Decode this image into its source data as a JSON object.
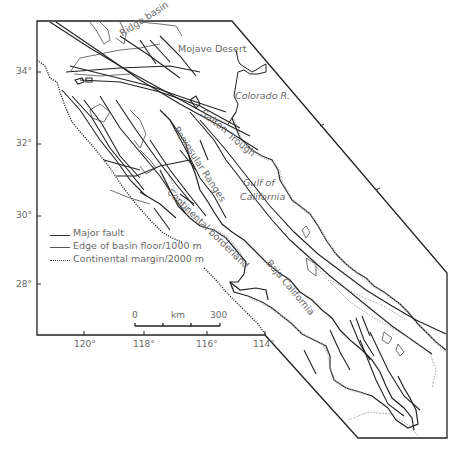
{
  "map": {
    "region_labels": {
      "ridge_basin": "Ridge basin",
      "mojave_desert": "Mojave Desert",
      "colorado_r": "Colorado R.",
      "salton": "Salton",
      "trough": "Trough",
      "peninsular_ranges": "Peninsular Ranges",
      "gulf_of": "Gulf of",
      "california": "California",
      "continental_borderland": "Continental borderland",
      "baja_california": "Baja California"
    },
    "latitude_ticks": [
      "34°",
      "32°",
      "30°",
      "28°"
    ],
    "longitude_ticks": [
      "120°",
      "118°",
      "116°",
      "114°"
    ],
    "scale_bar": {
      "start": "0",
      "unit": "km",
      "end": "300"
    },
    "legend": [
      {
        "symbol": "solid-thick",
        "label": "Major fault"
      },
      {
        "symbol": "solid-thin",
        "label": "Edge of basin floor/1000 m"
      },
      {
        "symbol": "dotted",
        "label": "Continental margin/2000 m"
      }
    ],
    "colors": {
      "line": "#222222",
      "label": "#6a6a6a",
      "coast_stipple": "#9a9a9a",
      "background": "#ffffff"
    }
  }
}
